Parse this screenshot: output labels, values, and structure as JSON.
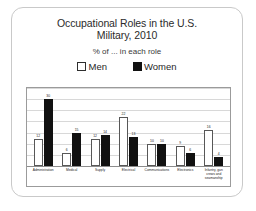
{
  "card": {
    "title_lines": [
      "Occupational Roles in the U.S.",
      "Military, 2010"
    ],
    "subtitle": "% of ... in each role"
  },
  "legend": {
    "position": "top",
    "items": [
      {
        "label": "Men",
        "color": "#ffffff",
        "swatch": "men-swatch"
      },
      {
        "label": "Women",
        "color": "#111111",
        "swatch": "women-swatch"
      }
    ]
  },
  "chart_data": {
    "type": "bar",
    "title": "Occupational Roles in the U.S. Military, 2010",
    "subtitle": "% of ... in each role",
    "xlabel": "",
    "ylabel": "",
    "ylim": [
      0,
      35
    ],
    "grid": true,
    "legend_position": "top",
    "categories": [
      "Administration",
      "Medical",
      "Supply",
      "Electrical",
      "Communications",
      "Electronics",
      "Infantry, gun crews and seamanship"
    ],
    "series": [
      {
        "name": "Men",
        "color": "#ffffff",
        "values": [
          12,
          6,
          12,
          22,
          10,
          9,
          16
        ]
      },
      {
        "name": "Women",
        "color": "#111111",
        "values": [
          30,
          15,
          14,
          13,
          10,
          6,
          4
        ]
      }
    ],
    "gridlines": [
      0,
      5,
      10,
      15,
      20,
      25,
      30,
      35
    ]
  }
}
